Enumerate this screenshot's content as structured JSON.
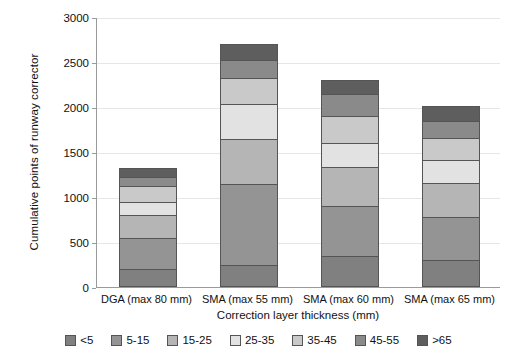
{
  "chart_data": {
    "type": "bar",
    "subtype": "stacked-bar",
    "title": "",
    "xlabel": "Correction layer thickness (mm)",
    "ylabel": "Cumulative points of runway corrector",
    "categories": [
      "DGA (max 80 mm)",
      "SMA (max 55 mm)",
      "SMA (max 60 mm)",
      "SMA (max 65 mm)"
    ],
    "series": [
      {
        "name": "<5",
        "color": "#808080",
        "values": [
          200,
          250,
          350,
          300
        ]
      },
      {
        "name": "5-15",
        "color": "#949494",
        "values": [
          350,
          900,
          550,
          480
        ]
      },
      {
        "name": "15-25",
        "color": "#b5b5b5",
        "values": [
          250,
          500,
          430,
          380
        ]
      },
      {
        "name": "25-35",
        "color": "#e2e2e2",
        "values": [
          150,
          380,
          270,
          250
        ]
      },
      {
        "name": "35-45",
        "color": "#c9c9c9",
        "values": [
          170,
          290,
          300,
          250
        ]
      },
      {
        "name": "45-55",
        "color": "#8a8a8a",
        "values": [
          100,
          200,
          250,
          180
        ]
      },
      {
        "name": ">65",
        "color": "#5e5e5e",
        "values": [
          100,
          180,
          150,
          170
        ]
      }
    ],
    "totals": [
      1320,
      2700,
      2300,
      2010
    ],
    "ylim": [
      0,
      3000
    ],
    "yticks": [
      0,
      500,
      1000,
      1500,
      2000,
      2500,
      3000
    ],
    "ytick_labels": [
      "0",
      "500",
      "1000",
      "1500",
      "2000",
      "2500",
      "3000"
    ],
    "grid": true,
    "legend_position": "bottom",
    "bar_width_px": 58
  },
  "axes": {
    "y_title": "Cumulative points of runway corrector",
    "x_title": "Correction layer thickness (mm)"
  }
}
